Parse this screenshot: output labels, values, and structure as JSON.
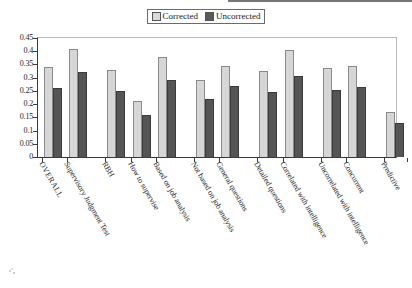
{
  "legend": {
    "entries": [
      {
        "label": "Corrected",
        "color": "#d6d6d6",
        "icon": "square-swatch-icon"
      },
      {
        "label": "Uncorrected",
        "color": "#555555",
        "icon": "square-swatch-icon"
      }
    ]
  },
  "axis": {
    "y_ticks": [
      "0",
      "0.05",
      "0.1",
      "0.15",
      "0.2",
      "0.25",
      "0.3",
      "0.35",
      "0.4",
      "0.45"
    ]
  },
  "chart_data": {
    "type": "bar",
    "title": "",
    "xlabel": "",
    "ylabel": "",
    "ylim": [
      0,
      0.45
    ],
    "ytick_step": 0.05,
    "grid": false,
    "legend_position": "top-center",
    "categories": [
      "OVERALL",
      "Supervisory Judgment Test",
      "RBH",
      "How to supervise",
      "Based on job analysis",
      "Not based on job analysis",
      "General questions",
      "Detailed questions",
      "Correlated with intelligence",
      "Uncorrelated with intelligence",
      "Concurrent",
      "Predictive"
    ],
    "group_breaks": [
      1,
      4,
      6,
      8,
      10
    ],
    "series": [
      {
        "name": "Corrected",
        "color": "#d6d6d6",
        "values": [
          0.34,
          0.41,
          0.33,
          0.21,
          0.38,
          0.29,
          0.345,
          0.325,
          0.405,
          0.335,
          0.343,
          0.17
        ]
      },
      {
        "name": "Uncorrected",
        "color": "#555555",
        "values": [
          0.26,
          0.32,
          0.25,
          0.16,
          0.29,
          0.22,
          0.267,
          0.245,
          0.305,
          0.255,
          0.265,
          0.13
        ]
      }
    ]
  }
}
